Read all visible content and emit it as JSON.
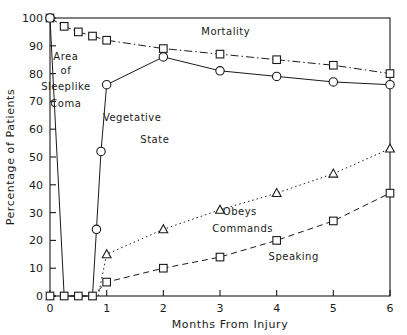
{
  "chart_data": {
    "type": "line",
    "title": "",
    "xlabel": "Months From Injury",
    "ylabel": "Percentage of Patients",
    "xlim": [
      0,
      6
    ],
    "ylim": [
      0,
      100
    ],
    "xticks": [
      0,
      1,
      2,
      3,
      4,
      5,
      6
    ],
    "yticks": [
      0,
      10,
      20,
      30,
      40,
      50,
      60,
      70,
      80,
      90,
      100
    ],
    "grid": false,
    "legend_position": "inline-annotations",
    "series": [
      {
        "name": "Mortality",
        "marker": "square",
        "linestyle": "dash-dot",
        "points": [
          [
            0.0,
            100
          ],
          [
            0.25,
            97
          ],
          [
            0.5,
            95
          ],
          [
            0.75,
            93.5
          ],
          [
            1.0,
            92
          ],
          [
            2.0,
            89
          ],
          [
            3.0,
            87
          ],
          [
            4.0,
            85
          ],
          [
            5.0,
            83
          ],
          [
            6.0,
            80
          ]
        ]
      },
      {
        "name": "Vegetative State",
        "marker": "circle",
        "linestyle": "solid",
        "points": [
          [
            0.0,
            100
          ],
          [
            0.25,
            0
          ],
          [
            0.5,
            0
          ],
          [
            0.75,
            0
          ],
          [
            0.82,
            24
          ],
          [
            0.9,
            52
          ],
          [
            1.0,
            76
          ],
          [
            2.0,
            86
          ],
          [
            3.0,
            81
          ],
          [
            4.0,
            79
          ],
          [
            5.0,
            77
          ],
          [
            6.0,
            76
          ]
        ]
      },
      {
        "name": "Obeys Commands",
        "marker": "triangle",
        "linestyle": "dotted",
        "points": [
          [
            0.85,
            0
          ],
          [
            1.0,
            15
          ],
          [
            2.0,
            24
          ],
          [
            3.0,
            31
          ],
          [
            4.0,
            37
          ],
          [
            5.0,
            44
          ],
          [
            6.0,
            53
          ]
        ]
      },
      {
        "name": "Speaking",
        "marker": "square",
        "linestyle": "dashed",
        "points": [
          [
            0.0,
            0
          ],
          [
            0.25,
            0
          ],
          [
            0.5,
            0
          ],
          [
            0.75,
            0
          ],
          [
            1.0,
            5
          ],
          [
            2.0,
            10
          ],
          [
            3.0,
            14
          ],
          [
            4.0,
            20
          ],
          [
            5.0,
            27
          ],
          [
            6.0,
            37
          ]
        ]
      }
    ],
    "annotations": [
      {
        "text": "Area",
        "x": 0.28,
        "y": 85
      },
      {
        "text": "of",
        "x": 0.28,
        "y": 80
      },
      {
        "text": "Sleeplike",
        "x": 0.28,
        "y": 74
      },
      {
        "text": "Coma",
        "x": 0.28,
        "y": 68
      },
      {
        "text": "Mortality",
        "x": 3.1,
        "y": 94
      },
      {
        "text": "Vegetative",
        "x": 1.45,
        "y": 63
      },
      {
        "text": "State",
        "x": 1.85,
        "y": 55
      },
      {
        "text": "Obeys",
        "x": 3.35,
        "y": 29
      },
      {
        "text": "Commands",
        "x": 3.4,
        "y": 23
      },
      {
        "text": "Speaking",
        "x": 4.3,
        "y": 13
      }
    ]
  },
  "colors": {
    "ink": "#1a1a1a",
    "background": "#ffffff"
  }
}
